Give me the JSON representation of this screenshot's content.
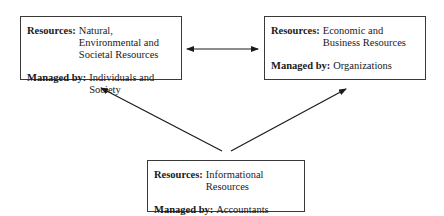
{
  "nodes": {
    "left": {
      "resources_label": "Resources:",
      "resources_value": "Natural, Environmental and Societal Resources",
      "managed_label": "Managed by:",
      "managed_value": "Individuals and Society"
    },
    "right": {
      "resources_label": "Resources:",
      "resources_value": "Economic and Business Resources",
      "managed_label": "Managed by:",
      "managed_value": "Organizations"
    },
    "bottom": {
      "resources_label": "Resources:",
      "resources_value": "Informational Resources",
      "managed_label": "Managed by:",
      "managed_value": "Accountants"
    }
  },
  "edges": [
    {
      "from": "left",
      "to": "right",
      "type": "bidirectional"
    },
    {
      "from": "bottom",
      "to": "left",
      "type": "directed"
    },
    {
      "from": "bottom",
      "to": "right",
      "type": "directed"
    }
  ],
  "colors": {
    "stroke": "#1a1a1a",
    "border": "#3a3a3a"
  }
}
